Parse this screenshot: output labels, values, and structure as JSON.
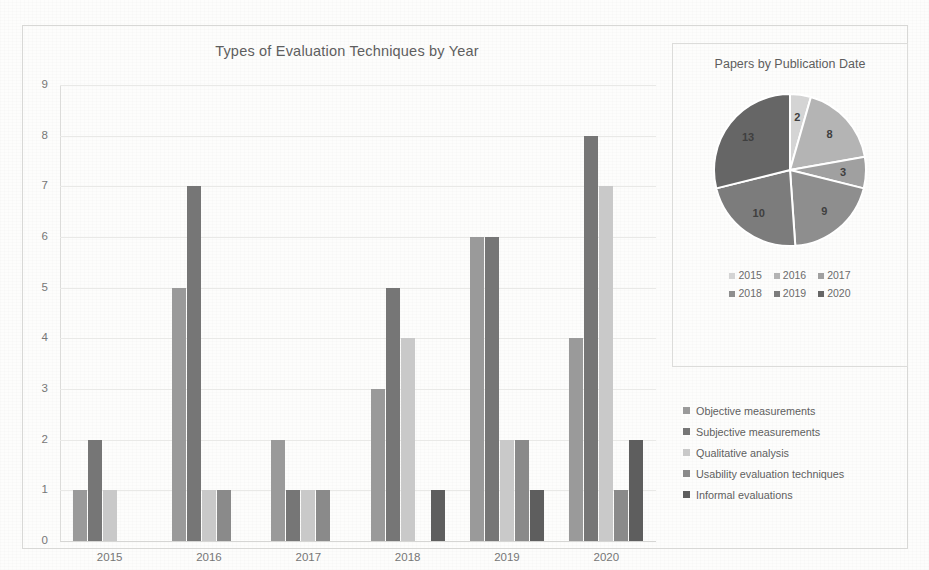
{
  "chart_data": [
    {
      "type": "bar",
      "title": "Types of Evaluation Techniques by Year",
      "xlabel": "",
      "ylabel": "",
      "ylim": [
        0,
        9
      ],
      "grid": true,
      "legend_position": "right",
      "categories": [
        "2015",
        "2016",
        "2017",
        "2018",
        "2019",
        "2020"
      ],
      "ytick_labels": [
        "0",
        "1",
        "2",
        "3",
        "4",
        "5",
        "6",
        "7",
        "8",
        "9"
      ],
      "series": [
        {
          "name": "Objective measurements",
          "color": "#9a9a9a",
          "values": [
            1,
            5,
            2,
            3,
            6,
            4
          ]
        },
        {
          "name": "Subjective measurements",
          "color": "#767676",
          "values": [
            2,
            7,
            1,
            5,
            6,
            8
          ]
        },
        {
          "name": "Qualitative analysis",
          "color": "#c9c9c9",
          "values": [
            1,
            1,
            1,
            4,
            2,
            7
          ]
        },
        {
          "name": "Usability evaluation techniques",
          "color": "#8a8a8a",
          "values": [
            0,
            1,
            1,
            0,
            2,
            1
          ]
        },
        {
          "name": "Informal evaluations",
          "color": "#5e5e5e",
          "values": [
            0,
            0,
            0,
            1,
            1,
            2
          ]
        }
      ]
    },
    {
      "type": "pie",
      "title": "Papers by Publication Date",
      "legend_position": "bottom",
      "labels": [
        "2015",
        "2016",
        "2017",
        "2018",
        "2019",
        "2020"
      ],
      "values": [
        2,
        8,
        3,
        9,
        10,
        13
      ],
      "total": 45,
      "colors": [
        "#d4d4d4",
        "#b4b4b4",
        "#a0a0a0",
        "#8e8e8e",
        "#7c7c7c",
        "#666666"
      ]
    }
  ],
  "bar_chart": {
    "title": "Types of Evaluation Techniques by Year",
    "categories": [
      "2015",
      "2016",
      "2017",
      "2018",
      "2019",
      "2020"
    ],
    "yticks": [
      "9",
      "8",
      "7",
      "6",
      "5",
      "4",
      "3",
      "2",
      "1",
      "0"
    ],
    "legend": [
      {
        "label": "Objective measurements",
        "color": "#9a9a9a"
      },
      {
        "label": "Subjective measurements",
        "color": "#767676"
      },
      {
        "label": "Qualitative analysis",
        "color": "#c9c9c9"
      },
      {
        "label": "Usability evaluation techniques",
        "color": "#8a8a8a"
      },
      {
        "label": "Informal evaluations",
        "color": "#5e5e5e"
      }
    ]
  },
  "pie_chart": {
    "title": "Papers by Publication Date",
    "slice_labels": [
      "2",
      "8",
      "3",
      "9",
      "10",
      "13"
    ],
    "legend_row_1": [
      {
        "label": "2015",
        "color": "#d4d4d4"
      },
      {
        "label": "2016",
        "color": "#b4b4b4"
      },
      {
        "label": "2017",
        "color": "#a0a0a0"
      }
    ],
    "legend_row_2": [
      {
        "label": "2018",
        "color": "#8e8e8e"
      },
      {
        "label": "2019",
        "color": "#7c7c7c"
      },
      {
        "label": "2020",
        "color": "#666666"
      }
    ]
  }
}
